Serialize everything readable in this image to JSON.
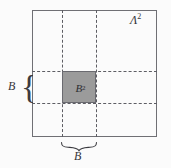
{
  "figure": {
    "outer_region": {
      "label_base": "Λ",
      "label_exponent": "2",
      "name": "lambda-squared"
    },
    "inner_region": {
      "label_base": "B",
      "label_exponent": "2",
      "fill_color": "#9b9b9b",
      "name": "b-squared"
    },
    "side_brace": {
      "glyph": "{",
      "label": "B"
    },
    "bottom_brace": {
      "label": "B"
    },
    "colors": {
      "background": "#fbfbfb",
      "outline": "#6f6f74",
      "dashed_guide": "#5d5d63",
      "inner_fill": "#9b9b9b",
      "text": "#35353a"
    }
  }
}
